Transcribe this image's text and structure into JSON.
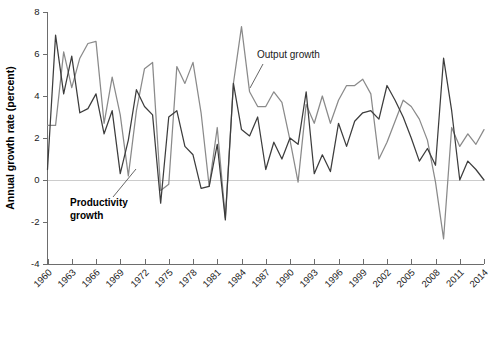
{
  "chart_data": {
    "type": "line",
    "title": "",
    "xlabel": "",
    "ylabel": "Annual growth rate (percent)",
    "ylim": [
      -4,
      8
    ],
    "xlim": [
      1960,
      2014
    ],
    "ytick_values": [
      8,
      6,
      4,
      2,
      0,
      -2,
      -4
    ],
    "ytick_labels": [
      "8",
      "6",
      "4",
      "2",
      "0",
      "-2",
      "-4"
    ],
    "xtick_values": [
      1960,
      1963,
      1966,
      1969,
      1972,
      1975,
      1978,
      1981,
      1984,
      1987,
      1990,
      1993,
      1996,
      1999,
      2002,
      2005,
      2008,
      2011,
      2014
    ],
    "xtick_labels": [
      "1960",
      "1963",
      "1966",
      "1969",
      "1972",
      "1975",
      "1978",
      "1981",
      "1984",
      "1987",
      "1990",
      "1993",
      "1996",
      "1999",
      "2002",
      "2005",
      "2008",
      "2011",
      "2014"
    ],
    "grid": false,
    "zero_line": true,
    "legend_position": "inline-annotations",
    "x": [
      1960,
      1961,
      1962,
      1963,
      1964,
      1965,
      1966,
      1967,
      1968,
      1969,
      1970,
      1971,
      1972,
      1973,
      1974,
      1975,
      1976,
      1977,
      1978,
      1979,
      1980,
      1981,
      1982,
      1983,
      1984,
      1985,
      1986,
      1987,
      1988,
      1989,
      1990,
      1991,
      1992,
      1993,
      1994,
      1995,
      1996,
      1997,
      1998,
      1999,
      2000,
      2001,
      2002,
      2003,
      2004,
      2005,
      2006,
      2007,
      2008,
      2009,
      2010,
      2011,
      2012,
      2013,
      2014
    ],
    "series": [
      {
        "name": "Output growth",
        "color": "#8a8a8a",
        "values": [
          2.6,
          2.6,
          6.1,
          4.4,
          5.8,
          6.5,
          6.6,
          2.7,
          4.9,
          3.1,
          0.2,
          3.3,
          5.3,
          5.6,
          -0.5,
          -0.2,
          5.4,
          4.6,
          5.6,
          3.2,
          -0.3,
          2.5,
          -1.8,
          4.6,
          7.3,
          4.2,
          3.5,
          3.5,
          4.2,
          3.7,
          1.9,
          -0.1,
          3.6,
          2.7,
          4.0,
          2.7,
          3.8,
          4.5,
          4.5,
          4.8,
          4.1,
          1.0,
          1.8,
          2.8,
          3.8,
          3.5,
          2.9,
          1.9,
          -0.1,
          -2.8,
          2.5,
          1.6,
          2.2,
          1.7,
          2.4
        ]
      },
      {
        "name": "Productivity growth",
        "color": "#3d3d3d",
        "values": [
          0.5,
          6.9,
          4.1,
          5.9,
          3.2,
          3.4,
          4.1,
          2.2,
          3.3,
          0.3,
          1.9,
          4.3,
          3.5,
          3.1,
          -1.1,
          3.0,
          3.3,
          1.6,
          1.2,
          -0.4,
          -0.3,
          1.7,
          -1.9,
          4.6,
          2.4,
          2.1,
          3.0,
          0.5,
          1.8,
          1.0,
          2.0,
          1.7,
          4.2,
          0.3,
          1.2,
          0.4,
          2.7,
          1.6,
          2.8,
          3.2,
          3.3,
          2.9,
          4.5,
          3.8,
          3.0,
          2.0,
          0.9,
          1.5,
          0.7,
          5.8,
          3.3,
          0.0,
          0.9,
          0.5,
          0.0
        ]
      }
    ],
    "annotations": [
      {
        "text": "Output growth",
        "series": "Output growth",
        "x_px": 257,
        "y_px": 58
      },
      {
        "text_line1": "Productivity",
        "text_line2": "growth",
        "series": "Productivity growth",
        "x_px": 70,
        "y_px": 206
      }
    ]
  },
  "axis": {
    "y_title": "Annual growth rate (percent)"
  }
}
